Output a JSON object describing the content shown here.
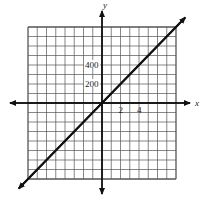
{
  "chart_data": {
    "type": "line",
    "title": "",
    "xlabel": "x",
    "ylabel": "y",
    "x_ticks_labeled": [
      {
        "value": 2,
        "label": "2"
      },
      {
        "value": 4,
        "label": "4"
      }
    ],
    "y_ticks_labeled": [
      {
        "value": 200,
        "label": "200"
      },
      {
        "value": 400,
        "label": "400"
      }
    ],
    "x_grid_step": 1,
    "y_grid_step": 100,
    "xlim": [
      -8,
      8
    ],
    "ylim": [
      -800,
      800
    ],
    "grid": true,
    "series": [
      {
        "name": "line",
        "equation": "y = 100x",
        "x": [
          -9,
          0,
          9
        ],
        "y": [
          -900,
          0,
          900
        ],
        "arrows_both_ends": true
      }
    ],
    "colors": {
      "line": "#111111",
      "grid": "#555555",
      "axes": "#111111"
    }
  }
}
